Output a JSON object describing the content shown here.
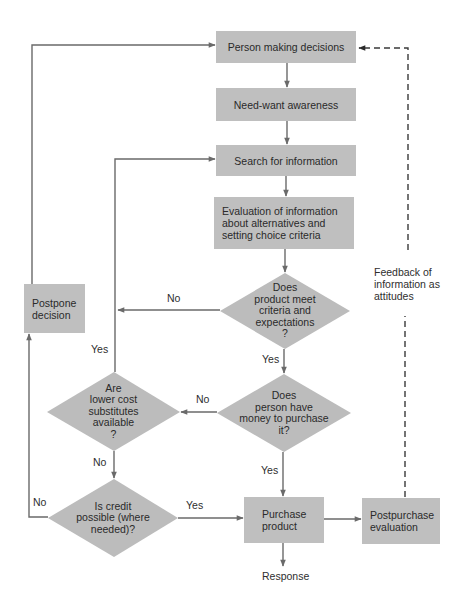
{
  "diagram": {
    "type": "flowchart",
    "title": "",
    "colors": {
      "box_fill": "#bfbfbf",
      "edge": "#6a6a6a",
      "feedback_edge": "#3a3a3a",
      "text": "#2a2a2a"
    },
    "nodes": {
      "person": {
        "label": "Person making decisions"
      },
      "awareness": {
        "label": "Need-want awareness"
      },
      "search": {
        "label": "Search for information"
      },
      "evaluation": {
        "label": "Evaluation of information\nabout alternatives and\nsetting choice criteria"
      },
      "meets_criteria": {
        "label": "Does\nproduct meet\ncriteria and\nexpectations\n?"
      },
      "has_money": {
        "label": "Does\nperson have\nmoney to purchase\nit?"
      },
      "substitutes": {
        "label": "Are\nlower cost\nsubstitutes\navailable\n?"
      },
      "credit": {
        "label": "Is credit\npossible (where\nneeded)?"
      },
      "postpone": {
        "label": "Postpone\ndecision"
      },
      "purchase": {
        "label": "Purchase\nproduct"
      },
      "postpurchase": {
        "label": "Postpurchase\nevaluation"
      }
    },
    "edge_labels": {
      "meets_no": "No",
      "meets_yes": "Yes",
      "money_no": "No",
      "money_yes": "Yes",
      "substitutes_yes": "Yes",
      "substitutes_no": "No",
      "credit_no": "No",
      "credit_yes": "Yes"
    },
    "annotations": {
      "feedback": "Feedback of\ninformation as\nattitudes",
      "response": "Response"
    },
    "edges": [
      {
        "from": "person",
        "to": "awareness",
        "label": ""
      },
      {
        "from": "awareness",
        "to": "search",
        "label": ""
      },
      {
        "from": "search",
        "to": "evaluation",
        "label": ""
      },
      {
        "from": "evaluation",
        "to": "meets_criteria",
        "label": ""
      },
      {
        "from": "meets_criteria",
        "to": "search",
        "label": "No"
      },
      {
        "from": "meets_criteria",
        "to": "has_money",
        "label": "Yes"
      },
      {
        "from": "has_money",
        "to": "substitutes",
        "label": "No"
      },
      {
        "from": "has_money",
        "to": "purchase",
        "label": "Yes"
      },
      {
        "from": "substitutes",
        "to": "search",
        "label": "Yes"
      },
      {
        "from": "substitutes",
        "to": "credit",
        "label": "No"
      },
      {
        "from": "credit",
        "to": "postpone",
        "label": "No"
      },
      {
        "from": "credit",
        "to": "purchase",
        "label": "Yes"
      },
      {
        "from": "postpone",
        "to": "person",
        "label": ""
      },
      {
        "from": "purchase",
        "to": "postpurchase",
        "label": ""
      },
      {
        "from": "purchase",
        "to": "response",
        "label": ""
      },
      {
        "from": "postpurchase",
        "to": "person",
        "label": "Feedback of information as attitudes",
        "style": "dashed"
      }
    ]
  }
}
